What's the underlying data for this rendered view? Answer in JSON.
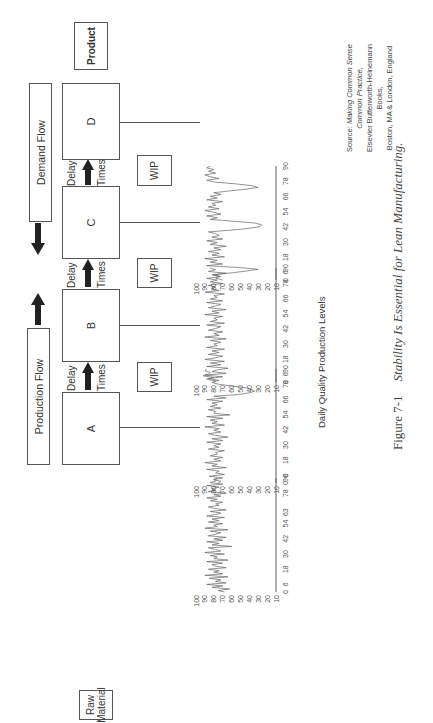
{
  "figure": {
    "orientation": "rotated 90 degrees counter-clockwise",
    "flows": {
      "production_flow": "Production Flow",
      "demand_flow": "Demand Flow"
    },
    "endpoints": {
      "raw_material_line1": "Raw",
      "raw_material_line2": "Material",
      "product": "Product"
    },
    "stations": [
      {
        "label": "A"
      },
      {
        "label": "B"
      },
      {
        "label": "C"
      },
      {
        "label": "D"
      }
    ],
    "transitions": [
      {
        "delay": "Delay",
        "times": "Times",
        "wip": "WIP"
      },
      {
        "delay": "Delay",
        "times": "Times",
        "wip": "WIP"
      },
      {
        "delay": "Delay",
        "times": "Times",
        "wip": "WIP"
      }
    ],
    "charts_title": "Daily Quality Production Levels",
    "source": {
      "prefix": "Source: ",
      "book": "Making Common Sense Common Practice,",
      "line2": "Elsevier Butterworth-Heinemann Books,",
      "line3": "Boston, MA & London, England"
    },
    "caption": {
      "number": "Figure 7-1",
      "text": "Stability Is Essential for Lean Manufacturing."
    }
  },
  "chart_data": [
    {
      "type": "line",
      "title": "Station A",
      "xlabel": "",
      "ylabel": "",
      "x_ticks": [
        "0",
        "6",
        "18",
        "30",
        "42",
        "54",
        "63",
        "78",
        "90"
      ],
      "y_ticks": [
        "100",
        "90",
        "80",
        "70",
        "60",
        "50",
        "40",
        "30",
        "20",
        "10"
      ],
      "ylim": [
        10,
        100
      ],
      "xlim": [
        0,
        90
      ],
      "grid": false,
      "values": [
        68,
        75,
        62,
        82,
        70,
        88,
        66,
        78,
        72,
        85,
        64,
        90,
        70,
        80,
        74,
        86,
        66,
        78,
        82,
        70,
        88,
        64,
        80,
        76,
        84,
        68,
        90,
        72,
        78,
        86,
        60,
        82,
        74,
        88,
        70,
        80,
        66,
        86,
        78,
        72,
        84,
        64,
        90,
        76,
        80,
        70,
        86,
        74,
        82,
        68,
        88,
        78,
        72,
        84,
        66,
        80,
        86,
        74,
        78,
        70,
        84,
        76,
        88,
        72,
        80,
        66,
        86,
        78,
        82,
        74,
        88,
        70,
        84,
        78,
        80,
        76
      ]
    },
    {
      "type": "line",
      "title": "Station B",
      "xlabel": "",
      "ylabel": "",
      "x_ticks": [
        "0",
        "6",
        "18",
        "30",
        "42",
        "54",
        "66",
        "78",
        "90"
      ],
      "y_ticks": [
        "100",
        "90",
        "80",
        "70",
        "60",
        "50",
        "40",
        "30",
        "20",
        "10"
      ],
      "ylim": [
        10,
        100
      ],
      "xlim": [
        0,
        90
      ],
      "grid": false,
      "values": [
        75,
        72,
        80,
        70,
        85,
        68,
        78,
        74,
        88,
        66,
        82,
        76,
        90,
        72,
        80,
        70,
        84,
        76,
        78,
        68,
        86,
        74,
        80,
        72,
        88,
        70,
        82,
        64,
        78,
        86,
        72,
        80,
        74,
        90,
        68,
        82,
        76,
        84,
        70,
        88,
        62,
        80,
        78,
        86,
        72,
        84,
        76,
        82,
        70,
        88,
        66,
        80,
        52,
        40,
        34,
        38,
        44,
        60,
        74,
        82,
        78,
        88,
        80,
        92,
        86,
        84,
        90,
        88
      ]
    },
    {
      "type": "line",
      "title": "Station C",
      "xlabel": "",
      "ylabel": "",
      "x_ticks": [
        "0",
        "6",
        "18",
        "30",
        "42",
        "54",
        "66",
        "78",
        "90"
      ],
      "y_ticks": [
        "100",
        "90",
        "80",
        "70",
        "60",
        "50",
        "40",
        "30",
        "20",
        "10"
      ],
      "ylim": [
        10,
        100
      ],
      "xlim": [
        0,
        90
      ],
      "grid": false,
      "values": [
        80,
        74,
        86,
        70,
        90,
        66,
        82,
        76,
        64,
        88,
        72,
        84,
        68,
        90,
        78,
        70,
        86,
        74,
        82,
        68,
        88,
        76,
        80,
        72,
        84,
        66,
        90,
        74,
        80,
        70,
        86,
        78,
        72,
        88,
        68,
        84,
        76,
        80,
        70,
        90,
        74,
        82,
        66,
        86,
        78,
        72,
        88,
        70,
        84,
        76,
        80,
        68,
        90,
        74,
        82,
        78,
        86,
        70,
        84,
        76,
        88,
        72,
        80,
        66,
        86,
        78,
        84
      ]
    },
    {
      "type": "line",
      "title": "Station D",
      "xlabel": "",
      "ylabel": "",
      "x_ticks": [
        "0",
        "6",
        "18",
        "30",
        "42",
        "54",
        "66",
        "78",
        "90"
      ],
      "y_ticks": [
        "100",
        "90",
        "80",
        "70",
        "60",
        "50",
        "40",
        "30",
        "20",
        "10"
      ],
      "ylim": [
        10,
        100
      ],
      "xlim": [
        0,
        90
      ],
      "grid": false,
      "values": [
        70,
        78,
        74,
        82,
        60,
        44,
        30,
        52,
        88,
        70,
        84,
        76,
        90,
        68,
        82,
        74,
        86,
        72,
        80,
        66,
        84,
        76,
        88,
        70,
        82,
        74,
        78,
        86,
        60,
        40,
        28,
        26,
        34,
        58,
        84,
        76,
        88,
        72,
        80,
        90,
        74,
        86,
        78,
        82,
        70,
        88,
        76,
        84,
        72,
        80,
        62,
        44,
        30,
        38,
        56,
        80,
        88,
        74,
        84,
        90,
        78,
        86,
        80,
        88,
        84
      ]
    }
  ]
}
